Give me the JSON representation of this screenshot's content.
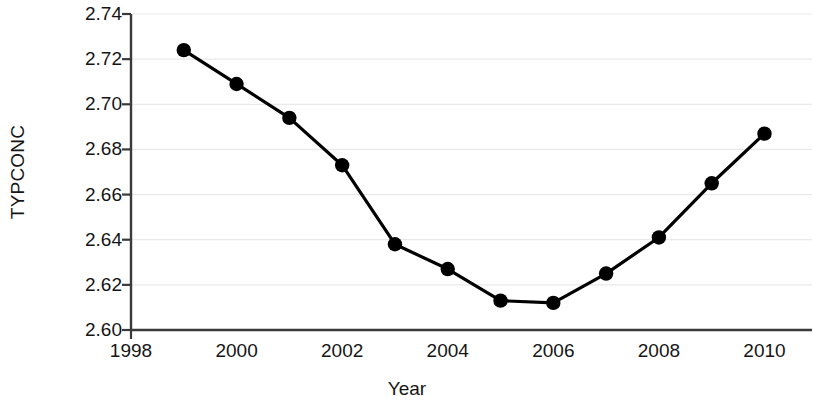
{
  "chart_data": {
    "type": "line",
    "title": "",
    "xlabel": "Year",
    "ylabel": "TYPCONC",
    "x": [
      1999,
      2000,
      2001,
      2002,
      2003,
      2004,
      2005,
      2006,
      2007,
      2008,
      2009,
      2010
    ],
    "values": [
      2.724,
      2.709,
      2.694,
      2.673,
      2.638,
      2.627,
      2.613,
      2.612,
      2.625,
      2.641,
      2.665,
      2.687
    ],
    "series": [
      {
        "name": "TYPCONC",
        "values": [
          2.724,
          2.709,
          2.694,
          2.673,
          2.638,
          2.627,
          2.613,
          2.612,
          2.625,
          2.641,
          2.665,
          2.687
        ]
      }
    ],
    "xlim": [
      1998,
      2010.9
    ],
    "ylim": [
      2.6,
      2.74
    ],
    "xticks": [
      1998,
      2000,
      2002,
      2004,
      2006,
      2008,
      2010
    ],
    "xtick_labels": [
      "1998",
      "2000",
      "2002",
      "2004",
      "2006",
      "2008",
      "2010"
    ],
    "yticks": [
      2.6,
      2.62,
      2.64,
      2.66,
      2.68,
      2.7,
      2.72,
      2.74
    ],
    "ytick_labels": [
      "2.60",
      "2.62",
      "2.64",
      "2.66",
      "2.68",
      "2.70",
      "2.72",
      "2.74"
    ],
    "grid": "horizontal",
    "grid_color": "#e9e9ea",
    "legend": "none",
    "marker": "circle",
    "marker_color": "#000000",
    "line_color": "#000000",
    "axis_color": "#3a3a3a"
  }
}
